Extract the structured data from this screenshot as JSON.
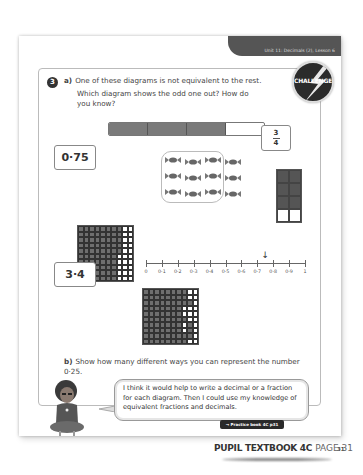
{
  "header": {
    "lesson": "Unit 11: Decimals (2), Lesson 6"
  },
  "question": {
    "number": "3",
    "part_a": {
      "label": "a)",
      "line1": "One of these diagrams is not equivalent to the rest.",
      "line2": "Which diagram shows the odd one out? How do you know?"
    },
    "part_b": {
      "label": "b)",
      "text": "Show how many different ways you can represent the number 0·25."
    }
  },
  "badge": {
    "label": "CHALLENGE"
  },
  "diagrams": {
    "bar_model": {
      "segments": 4,
      "shaded": 3
    },
    "decimal_box_1": "0·75",
    "fraction_box": {
      "numerator": "3",
      "denominator": "4"
    },
    "sweets": {
      "total": 12,
      "columns": 4,
      "rows": 3,
      "circled": 9
    },
    "rect_grid": {
      "columns": 2,
      "rows": 4,
      "shaded": 6
    },
    "hundred_square_a": {
      "shaded_per_row": [
        8,
        8,
        8,
        8,
        8,
        7,
        7,
        7,
        7,
        7
      ]
    },
    "number_line": {
      "labels": [
        "0",
        "0·1",
        "0·2",
        "0·3",
        "0·4",
        "0·5",
        "0·6",
        "0·7",
        "0·8",
        "0·9",
        "1"
      ],
      "arrow_at": 0.75,
      "arrow_glyph": "↓"
    },
    "decimal_box_2": "3·4",
    "hundred_square_b": {
      "white_cells": [
        [
          0,
          8
        ],
        [
          0,
          9
        ],
        [
          1,
          8
        ],
        [
          1,
          9
        ],
        [
          2,
          9
        ],
        [
          3,
          7
        ],
        [
          3,
          8
        ],
        [
          3,
          9
        ],
        [
          4,
          7
        ],
        [
          4,
          8
        ],
        [
          4,
          9
        ],
        [
          5,
          8
        ],
        [
          5,
          9
        ],
        [
          6,
          7
        ],
        [
          6,
          9
        ],
        [
          7,
          7
        ],
        [
          7,
          9
        ],
        [
          8,
          9
        ],
        [
          9,
          8
        ],
        [
          9,
          9
        ]
      ]
    }
  },
  "speech": {
    "text": "I think it would help to write a decimal or a fraction for each diagram. Then I could use my knowledge of equivalent fractions and decimals."
  },
  "footer": {
    "practice_link": "→ Practice book 4C p31",
    "page_number": "31",
    "book_title": "PUPIL TEXTBOOK 4C",
    "book_page": "PAGE 31"
  }
}
